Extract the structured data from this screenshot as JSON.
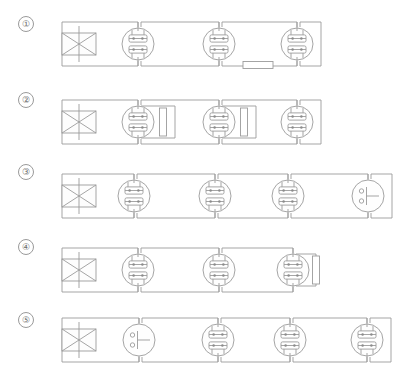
{
  "diagram": {
    "stroke_color": "#9b9b9b",
    "label_color": "#6d6d6d",
    "background": "#ffffff",
    "legend": {
      "source_symbol": "crossed-rectangle-source",
      "unit_symbol": "circular-terminal-unit",
      "gauge_symbol": "circular-gauge-unit",
      "resistor_symbol": "resistor-rectangle"
    },
    "rows": [
      {
        "label": "①",
        "index": 1,
        "y": 44,
        "source": {
          "name": "source",
          "x": 62,
          "width": 34,
          "height": 22
        },
        "units": [
          {
            "type": "terminal",
            "x": 138
          },
          {
            "type": "terminal",
            "x": 219
          },
          {
            "type": "terminal",
            "x": 297
          }
        ],
        "resistors": [
          {
            "orientation": "horizontal",
            "x": 243,
            "y": 65,
            "length": 30,
            "thickness": 7
          }
        ],
        "branches": []
      },
      {
        "label": "②",
        "index": 2,
        "y": 122,
        "source": {
          "name": "source",
          "x": 62,
          "width": 34,
          "height": 22
        },
        "units": [
          {
            "type": "terminal",
            "x": 138
          },
          {
            "type": "terminal",
            "x": 219
          },
          {
            "type": "terminal",
            "x": 297
          }
        ],
        "resistors": [
          {
            "orientation": "vertical",
            "x": 163,
            "y": 122,
            "length": 28,
            "thickness": 7
          },
          {
            "orientation": "vertical",
            "x": 244,
            "y": 122,
            "length": 28,
            "thickness": 7
          }
        ],
        "branches": [
          {
            "from_x": 138,
            "to_x": 175
          },
          {
            "from_x": 219,
            "to_x": 256
          }
        ]
      },
      {
        "label": "③",
        "index": 3,
        "y": 196,
        "source": {
          "name": "source",
          "x": 62,
          "width": 34,
          "height": 22
        },
        "units": [
          {
            "type": "terminal",
            "x": 134
          },
          {
            "type": "terminal",
            "x": 215
          },
          {
            "type": "terminal",
            "x": 288
          },
          {
            "type": "gauge",
            "x": 368
          }
        ],
        "resistors": [],
        "branches": []
      },
      {
        "label": "④",
        "index": 4,
        "y": 270,
        "source": {
          "name": "source",
          "x": 62,
          "width": 34,
          "height": 22
        },
        "units": [
          {
            "type": "terminal",
            "x": 138
          },
          {
            "type": "terminal",
            "x": 219
          },
          {
            "type": "terminal",
            "x": 293
          }
        ],
        "resistors": [
          {
            "orientation": "vertical",
            "x": 316,
            "y": 270,
            "length": 28,
            "thickness": 7
          }
        ],
        "branches": [
          {
            "from_x": 293,
            "to_x": 316
          }
        ]
      },
      {
        "label": "⑤",
        "index": 5,
        "y": 340,
        "source": {
          "name": "source",
          "x": 62,
          "width": 34,
          "height": 22
        },
        "units": [
          {
            "type": "gauge",
            "x": 139
          },
          {
            "type": "terminal",
            "x": 218
          },
          {
            "type": "terminal",
            "x": 290
          },
          {
            "type": "terminal",
            "x": 367
          }
        ],
        "resistors": [],
        "branches": []
      }
    ],
    "labels": [
      {
        "text": "①",
        "x": 22,
        "y": 22
      },
      {
        "text": "②",
        "x": 22,
        "y": 98
      },
      {
        "text": "③",
        "x": 22,
        "y": 170
      },
      {
        "text": "④",
        "x": 22,
        "y": 245
      },
      {
        "text": "⑤",
        "x": 22,
        "y": 318
      }
    ]
  }
}
